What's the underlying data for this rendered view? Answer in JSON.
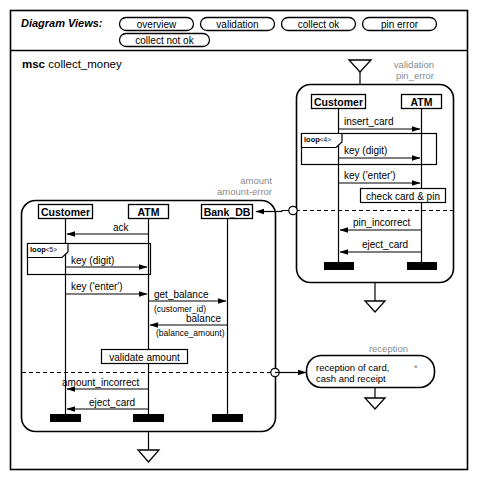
{
  "toolbar": {
    "label": "Diagram Views:",
    "chips": [
      {
        "id": "overview",
        "label": "overview"
      },
      {
        "id": "validation",
        "label": "validation"
      },
      {
        "id": "collect-ok",
        "label": "collect ok"
      },
      {
        "id": "pin-error",
        "label": "pin error"
      },
      {
        "id": "collect-not-ok",
        "label": "collect not ok"
      }
    ]
  },
  "diagram": {
    "keyword": "msc",
    "name": "collect_money"
  },
  "main_chart": {
    "lifelines": [
      {
        "id": "customer",
        "label": "Customer"
      },
      {
        "id": "atm",
        "label": "ATM"
      },
      {
        "id": "bank-db",
        "label": "Bank_DB"
      }
    ],
    "loop": {
      "keyword": "loop",
      "count": "<5>"
    },
    "messages": [
      {
        "id": "ack",
        "label": "ack"
      },
      {
        "id": "key-digit",
        "label": "key (digit)"
      },
      {
        "id": "key-enter",
        "label": "key ('enter')"
      },
      {
        "id": "get-balance",
        "label": "get_balance",
        "param": "(customer_id)"
      },
      {
        "id": "balance",
        "label": "balance",
        "param": "(balance_amount)"
      },
      {
        "id": "amount-incorrect",
        "label": "amount_incorrect"
      },
      {
        "id": "eject-card",
        "label": "eject_card"
      }
    ],
    "action": {
      "id": "validate-amount",
      "label": "validate amount"
    },
    "gate_labels": {
      "line1": "amount",
      "line2": "amount-error"
    }
  },
  "validation_chart": {
    "gate_labels": {
      "line1": "validation",
      "line2": "pin_error"
    },
    "lifelines": [
      {
        "id": "customer",
        "label": "Customer"
      },
      {
        "id": "atm",
        "label": "ATM"
      }
    ],
    "loop": {
      "keyword": "loop",
      "count": "<4>"
    },
    "messages": [
      {
        "id": "insert-card",
        "label": "insert_card"
      },
      {
        "id": "key-digit",
        "label": "key (digit)"
      },
      {
        "id": "key-enter",
        "label": "key ('enter')"
      },
      {
        "id": "pin-incorrect",
        "label": "pin_incorrect"
      },
      {
        "id": "eject-card",
        "label": "eject_card"
      }
    ],
    "action": {
      "id": "check-card-and-pin",
      "label": "check card & pin"
    }
  },
  "reception_node": {
    "gate_label": "reception",
    "line1": "reception of card,",
    "line2": "cash and receipt",
    "marker": "*"
  },
  "colors": {
    "stroke": "#000000",
    "gray_label": "#8a8a8a",
    "fill_white": "#ffffff",
    "activation_fill": "#000000",
    "page_bg": "#ffffff"
  }
}
